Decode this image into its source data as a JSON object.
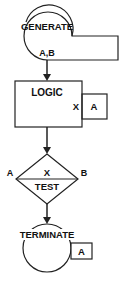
{
  "diagram": {
    "type": "GPSS block diagram",
    "blocks": [
      {
        "id": "generate",
        "label": "GENERATE",
        "operands": "A,B"
      },
      {
        "id": "logic",
        "label": "LOGIC",
        "mode": "X",
        "operand": "A"
      },
      {
        "id": "test",
        "label": "TEST",
        "mode": "X",
        "left_operand": "A",
        "right_operand": "B"
      },
      {
        "id": "terminate",
        "label": "TERMINATE",
        "operand": "A"
      }
    ],
    "colors": {
      "line": "#222222",
      "background": "#ffffff"
    }
  }
}
